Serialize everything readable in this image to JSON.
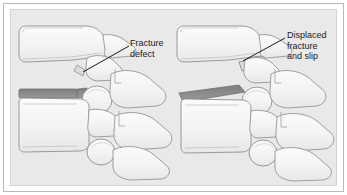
{
  "figure": {
    "type": "medical-illustration",
    "panel_background": "#e9e9e9",
    "frame_background": "#ffffff",
    "frame_border_color": "#b9b9b9",
    "bone_fill": "#f2f2f2",
    "bone_outline": "#8f8f8f",
    "fracture_band_color": "#8a8a8a",
    "leader_line_color": "#1a1a1a",
    "text_color": "#1a1a1a"
  },
  "annotations": {
    "left": {
      "id": "fracture-defect",
      "line1": "Fracture",
      "line2": "defect",
      "full_text": "Fracture defect",
      "leader_from": [
        118,
        44
      ],
      "leader_to": [
        72,
        62
      ]
    },
    "right": {
      "id": "displaced-fracture-and-slip",
      "line1": "Displaced",
      "line2": "fracture",
      "line3": "and slip",
      "full_text": "Displaced fracture and slip",
      "leader_from": [
        274,
        36
      ],
      "leader_to": [
        232,
        59
      ]
    }
  },
  "diagrams": [
    {
      "id": "left-diagram",
      "name": "intact-fracture-defect",
      "description": "Lateral view of two lumbar vertebrae with a fracture defect in the pars interarticularis; vertebral bodies remain aligned",
      "vertebra_count": 2,
      "disc_band_visible": true,
      "displaced": false
    },
    {
      "id": "right-diagram",
      "name": "displaced-fracture-slip",
      "description": "Lateral view of two lumbar vertebrae where the fracture has displaced and the upper vertebral body has slipped forward",
      "vertebra_count": 2,
      "disc_band_visible": true,
      "displaced": true
    }
  ]
}
